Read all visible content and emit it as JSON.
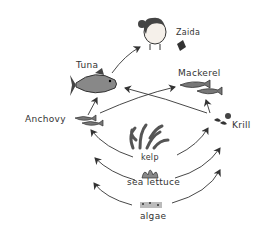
{
  "diagram": {
    "type": "food-web",
    "nodes": [
      {
        "id": "zaida",
        "label": "Zaida"
      },
      {
        "id": "tuna",
        "label": "Tuna"
      },
      {
        "id": "mackerel",
        "label": "Mackerel"
      },
      {
        "id": "anchovy",
        "label": "Anchovy"
      },
      {
        "id": "krill",
        "label": "Krill"
      },
      {
        "id": "kelp",
        "label": "kelp"
      },
      {
        "id": "sea_lettuce",
        "label": "sea lettuce"
      },
      {
        "id": "algae",
        "label": "algae"
      }
    ],
    "edges": [
      {
        "from": "tuna",
        "to": "zaida"
      },
      {
        "from": "anchovy",
        "to": "tuna"
      },
      {
        "from": "krill",
        "to": "tuna"
      },
      {
        "from": "anchovy",
        "to": "mackerel"
      },
      {
        "from": "krill",
        "to": "mackerel"
      },
      {
        "from": "kelp",
        "to": "anchovy"
      },
      {
        "from": "kelp",
        "to": "krill"
      },
      {
        "from": "sea_lettuce",
        "to": "anchovy"
      },
      {
        "from": "sea_lettuce",
        "to": "krill"
      },
      {
        "from": "algae",
        "to": "anchovy"
      },
      {
        "from": "algae",
        "to": "krill"
      }
    ]
  }
}
